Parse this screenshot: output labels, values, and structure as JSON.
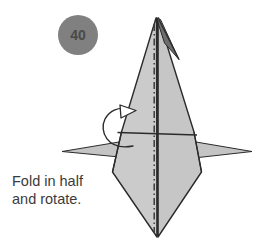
{
  "diagram": {
    "step_badge": {
      "number": "40",
      "fill_color": "#808080",
      "text_color": "#4a4a4a",
      "cx": 78,
      "cy": 35,
      "r": 20
    },
    "caption": {
      "line1": "Fold in half",
      "line2": "and rotate.",
      "color": "#3b3b3b"
    },
    "colors": {
      "paper_fill": "#c9c9c9",
      "paper_fill_light": "#d2d2d2",
      "paper_fill_dark": "#b4b4b4",
      "outline": "#2b2b2b",
      "fold_line": "#2b2b2b",
      "background": "#ffffff"
    },
    "shapes": {
      "body_left": {
        "name": "left-panel",
        "points": "156,18 122,132 113,172 157,237 156,18"
      },
      "body_right": {
        "name": "right-panel",
        "points": "158,18 194,132 201,172 158,237 158,18"
      },
      "apex_sliver": {
        "name": "apex-flap",
        "points": "156,18 160,19 178,58 166,46"
      },
      "wing_left": {
        "name": "left-wing-flap",
        "points": "119,143 63,152 129,158"
      },
      "wing_right": {
        "name": "right-wing-flap",
        "points": "196,143 251,152 186,159"
      },
      "horizontal_fold": {
        "name": "horizontal-fold-line",
        "x1": 118,
        "y1": 133,
        "x2": 197,
        "y2": 135
      },
      "center_axis": {
        "name": "center-fold-axis",
        "x1": 155,
        "y1": 22,
        "x2": 155,
        "y2": 234,
        "style": "dash-dot"
      },
      "center_edge": {
        "name": "center-edge-line",
        "x1": 158,
        "y1": 20,
        "x2": 158,
        "y2": 236
      },
      "rotate_arrow": {
        "name": "rotate-arrow",
        "path": "M 131,146 C 104,150 100,128 108,117 C 114,109 122,108 129,110",
        "head": "121,107 135,111 122,118"
      }
    }
  }
}
